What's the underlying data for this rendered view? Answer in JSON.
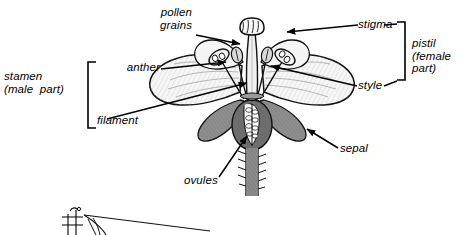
{
  "figure": {
    "background_color": "#ffffff",
    "ink_color": "#000000",
    "sepal_color": "#8a8a8a",
    "petal_color": "#f2f2f2"
  },
  "labels": {
    "pollen_grains": "pollen\ngrains",
    "anther": "anther",
    "filament": "filament",
    "stamen_group": "stamen\n(male  part)",
    "stigma": "stigma",
    "style": "style",
    "pistil_group": "pistil\n(female\npart)",
    "sepal": "sepal",
    "ovules": "ovules"
  },
  "brackets": {
    "stamen": {
      "side": "right",
      "x": 88,
      "top": 62,
      "bottom": 128
    },
    "pistil": {
      "side": "left",
      "x": 405,
      "top": 22,
      "bottom": 80
    }
  },
  "leaders": [
    {
      "name": "pollen-grains",
      "from": [
        196,
        36
      ],
      "to": [
        243,
        45
      ]
    },
    {
      "name": "anther",
      "from": [
        161,
        68
      ],
      "to": [
        229,
        62
      ]
    },
    {
      "name": "filament",
      "from": [
        107,
        118
      ],
      "to": [
        250,
        82
      ]
    },
    {
      "name": "stigma",
      "from": [
        358,
        25
      ],
      "to": [
        284,
        32
      ]
    },
    {
      "name": "style",
      "from": [
        357,
        86
      ],
      "to": [
        268,
        65
      ]
    },
    {
      "name": "sepal",
      "from": [
        338,
        148
      ],
      "to": [
        305,
        128
      ]
    },
    {
      "name": "ovules",
      "from": [
        219,
        178
      ],
      "to": [
        249,
        134
      ]
    }
  ]
}
